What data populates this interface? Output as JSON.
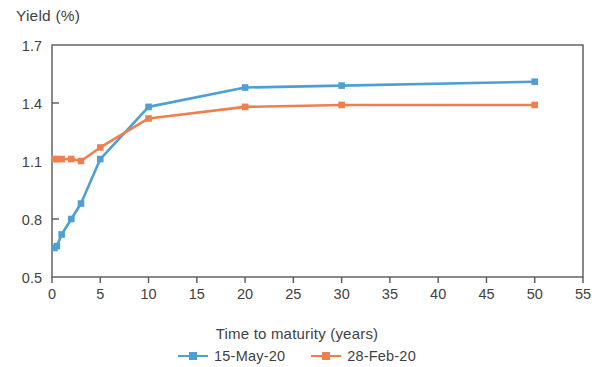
{
  "chart_data": {
    "type": "line",
    "title": "",
    "ylabel": "Yield (%)",
    "xlabel": "Time to maturity (years)",
    "xlim": [
      0,
      55
    ],
    "ylim": [
      0.5,
      1.7
    ],
    "xticks": [
      0,
      5,
      10,
      15,
      20,
      25,
      30,
      35,
      40,
      45,
      50,
      55
    ],
    "xtick_labels": [
      "0",
      "5",
      "10",
      "15",
      "20",
      "25",
      "30",
      "35",
      "40",
      "45",
      "50",
      "55"
    ],
    "yticks": [
      0.5,
      0.8,
      1.1,
      1.4,
      1.7
    ],
    "ytick_labels": [
      "0.5",
      "0.8",
      "1.1",
      "1.4",
      "1.7"
    ],
    "grid": false,
    "legend_position": "bottom",
    "marker": "square",
    "series": [
      {
        "name": "15-May-20",
        "color": "#4f9ed4",
        "x": [
          0.25,
          0.5,
          1,
          2,
          3,
          5,
          10,
          20,
          30,
          50
        ],
        "values": [
          0.65,
          0.66,
          0.72,
          0.8,
          0.88,
          1.11,
          1.38,
          1.48,
          1.49,
          1.51
        ]
      },
      {
        "name": "28-Feb-20",
        "color": "#f07f50",
        "x": [
          0.25,
          0.5,
          1,
          2,
          3,
          5,
          10,
          20,
          30,
          50
        ],
        "values": [
          1.11,
          1.11,
          1.11,
          1.11,
          1.1,
          1.17,
          1.32,
          1.38,
          1.39,
          1.39
        ]
      }
    ]
  },
  "axes": {
    "y_title": "Yield (%)",
    "x_title": "Time to maturity (years)"
  },
  "legend": {
    "entries": [
      {
        "label": "15-May-20",
        "color": "#4f9ed4"
      },
      {
        "label": "28-Feb-20",
        "color": "#f07f50"
      }
    ]
  },
  "colors": {
    "series_1": "#4f9ed4",
    "series_2": "#f07f50",
    "axis": "#585858",
    "text": "#3f3f3f"
  }
}
